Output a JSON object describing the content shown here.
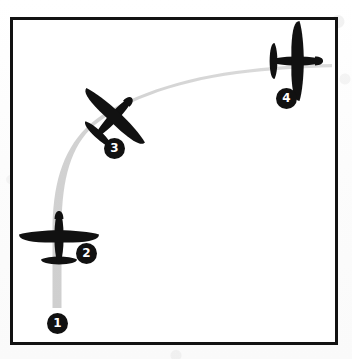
{
  "figure": {
    "background_color": "#ffffff",
    "frame_color": "#121212",
    "silhouette_color": "#111111",
    "path_color": "#d2d2d2",
    "marker_text_color": "#ffffff"
  },
  "flight_path": {
    "name": "turn-path",
    "stroke": "#d2d2d2",
    "start_width_px": 9,
    "end_width_px": 3,
    "description": "Light gray tapering band curving from bottom-left upward then bending right toward the top-right corner."
  },
  "positions": [
    {
      "number": "1",
      "label": "1",
      "role": "path start marker",
      "has_aircraft": false,
      "heading": "north",
      "x": 57,
      "y": 323
    },
    {
      "number": "2",
      "label": "2",
      "role": "aircraft position",
      "has_aircraft": true,
      "heading": "north",
      "bank_degrees": 0,
      "x": 86,
      "y": 253
    },
    {
      "number": "3",
      "label": "3",
      "role": "aircraft position",
      "has_aircraft": true,
      "heading": "northeast",
      "bank_degrees": 43,
      "x": 114,
      "y": 148
    },
    {
      "number": "4",
      "label": "4",
      "role": "aircraft position",
      "has_aircraft": true,
      "heading": "east",
      "bank_degrees": 90,
      "x": 286,
      "y": 98
    }
  ]
}
